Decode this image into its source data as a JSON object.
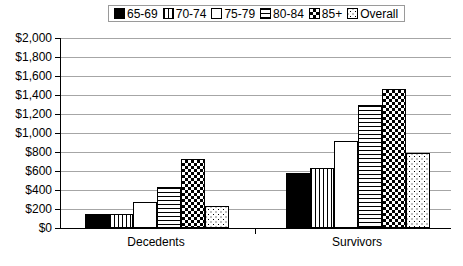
{
  "legend": {
    "position": "top-center",
    "items": [
      {
        "label": "65-69",
        "pattern": "solid-black"
      },
      {
        "label": "70-74",
        "pattern": "vertical-lines"
      },
      {
        "label": "75-79",
        "pattern": "white"
      },
      {
        "label": "80-84",
        "pattern": "horizontal-lines"
      },
      {
        "label": "85+",
        "pattern": "checkerboard"
      },
      {
        "label": "Overall",
        "pattern": "light-dots"
      }
    ]
  },
  "yaxis": {
    "ticks": [
      "$2,000",
      "$1,800",
      "$1,600",
      "$1,400",
      "$1,200",
      "$1,000",
      "$800",
      "$600",
      "$400",
      "$200",
      "$0"
    ],
    "min": 0,
    "max": 2000,
    "step": 200
  },
  "xaxis": {
    "categories": [
      "Decedents",
      "Survivors"
    ]
  },
  "colors": {
    "ink": "#000000",
    "gridline": "#a6a6a6",
    "background": "#ffffff",
    "legend_border": "#9a9a9a"
  },
  "chart_data": {
    "type": "bar",
    "title": "",
    "xlabel": "",
    "ylabel": "",
    "ylim": [
      0,
      2000
    ],
    "ytick_step": 200,
    "grid": true,
    "legend_position": "top-center",
    "categories": [
      "Decedents",
      "Survivors"
    ],
    "series": [
      {
        "name": "65-69",
        "values": [
          150,
          580
        ]
      },
      {
        "name": "70-74",
        "values": [
          150,
          630
        ]
      },
      {
        "name": "75-79",
        "values": [
          270,
          920
        ]
      },
      {
        "name": "80-84",
        "values": [
          430,
          1295
        ]
      },
      {
        "name": "85+",
        "values": [
          725,
          1460
        ]
      },
      {
        "name": "Overall",
        "values": [
          230,
          785
        ]
      }
    ]
  }
}
